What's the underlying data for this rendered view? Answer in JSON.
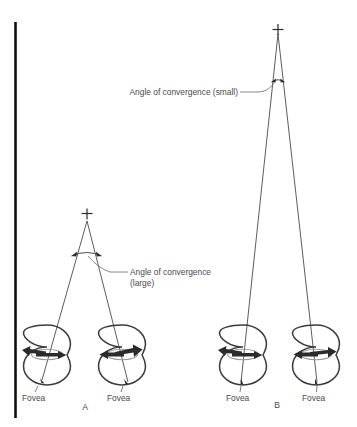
{
  "figure": {
    "background_color": "#ffffff",
    "line_color": "#4a4a4a",
    "rule_color": "#111111"
  },
  "annotations": {
    "small_angle_label": "Angle of convergence (small)",
    "large_angle_label_line1": "Angle of convergence",
    "large_angle_label_line2": "(large)"
  },
  "groups": [
    {
      "letter": "A",
      "condition": "near fixation",
      "angle": "large",
      "eyes": [
        {
          "side": "left",
          "fovea_label": "Fovea"
        },
        {
          "side": "right",
          "fovea_label": "Fovea"
        }
      ]
    },
    {
      "letter": "B",
      "condition": "far fixation",
      "angle": "small",
      "eyes": [
        {
          "side": "left",
          "fovea_label": "Fovea"
        },
        {
          "side": "right",
          "fovea_label": "Fovea"
        }
      ]
    }
  ],
  "fixation_markers": [
    {
      "group": "A",
      "glyph": "+"
    },
    {
      "group": "B",
      "glyph": "+"
    }
  ]
}
